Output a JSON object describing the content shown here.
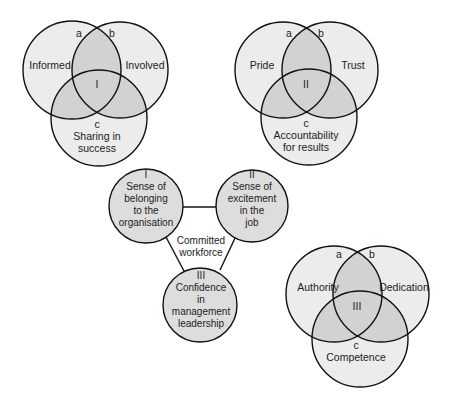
{
  "colors": {
    "single_fill": "#ececec",
    "overlap_fill": "#d2d2d2",
    "stroke": "#111111",
    "node_fill": "#dddddd",
    "background": "#ffffff"
  },
  "venn_top_left": {
    "center_label": "I",
    "circles": [
      {
        "key": "a",
        "label": "Informed"
      },
      {
        "key": "b",
        "label": "Involved"
      },
      {
        "key": "c",
        "label_lines": [
          "Sharing in",
          "success"
        ]
      }
    ]
  },
  "venn_top_right": {
    "center_label": "II",
    "circles": [
      {
        "key": "a",
        "label": "Pride"
      },
      {
        "key": "b",
        "label": "Trust"
      },
      {
        "key": "c",
        "label_lines": [
          "Accountability",
          "for results"
        ]
      }
    ]
  },
  "venn_bottom_right": {
    "center_label": "III",
    "circles": [
      {
        "key": "a",
        "label": "Authority"
      },
      {
        "key": "b",
        "label": "Dedication"
      },
      {
        "key": "c",
        "label": "Competence"
      }
    ]
  },
  "triangle": {
    "center_lines": [
      "Committed",
      "workforce"
    ],
    "nodes": [
      {
        "numeral": "I",
        "lines": [
          "Sense of",
          "belonging",
          "to the",
          "organisation"
        ]
      },
      {
        "numeral": "II",
        "lines": [
          "Sense of",
          "excitement",
          "in the",
          "job"
        ]
      },
      {
        "numeral": "III",
        "lines": [
          "Confidence",
          "in",
          "management",
          "leadership"
        ]
      }
    ]
  }
}
